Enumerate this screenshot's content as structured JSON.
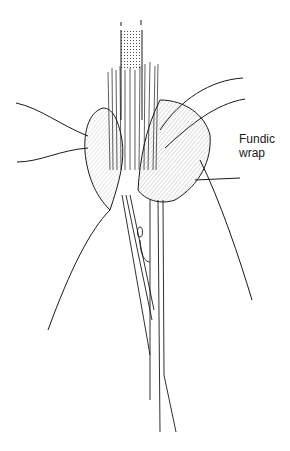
{
  "figure": {
    "annotations": [
      {
        "line1": "Fundic",
        "line2": "wrap"
      }
    ],
    "colors": {
      "ink": "#1a1a1a",
      "background": "#ffffff"
    }
  }
}
